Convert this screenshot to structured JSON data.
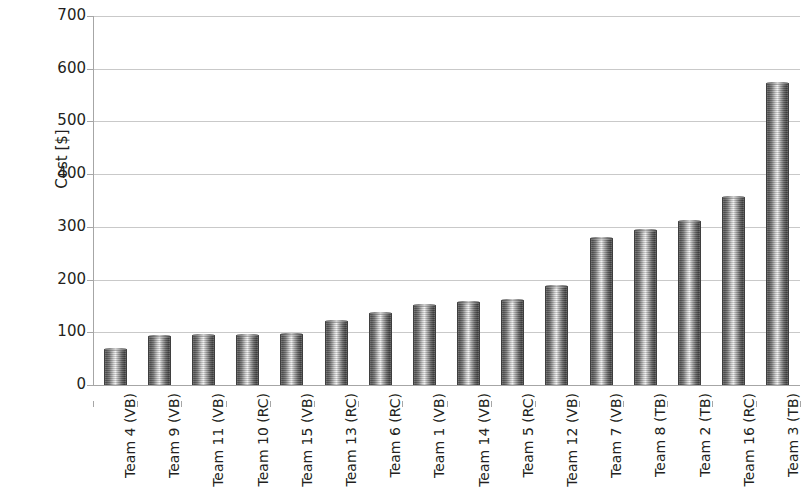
{
  "chart_data": {
    "type": "bar",
    "title": "",
    "xlabel": "",
    "ylabel": "Cost [$]",
    "ylim": [
      0,
      700
    ],
    "ytick_step": 100,
    "yticks": [
      "700",
      "600",
      "500",
      "400",
      "300",
      "200",
      "100",
      "0"
    ],
    "grid": true,
    "legend": "none",
    "categories": [
      "Team 4 (VB)",
      "Team 9 (VB)",
      "Team 11 (VB)",
      "Team 10 (RC)",
      "Team 15 (VB)",
      "Team 13 (RC)",
      "Team 6 (RC)",
      "Team 1 (VB)",
      "Team 14 (VB)",
      "Team 5 (RC)",
      "Team 12 (VB)",
      "Team 7 (VB)",
      "Team 8 (TB)",
      "Team 2 (TB)",
      "Team 16 (RC)",
      "Team 3 (TB)"
    ],
    "values": [
      68,
      93,
      95,
      94,
      96,
      122,
      137,
      151,
      158,
      161,
      188,
      278,
      295,
      311,
      356,
      573
    ]
  },
  "colors": {
    "bar_dark": "#4a4a4a",
    "bar_light": "#efefef",
    "gridline": "#c9c9c9",
    "axis": "#a6a6a6",
    "text": "#231f20",
    "background": "#ffffff"
  }
}
